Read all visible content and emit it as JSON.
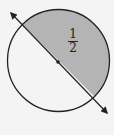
{
  "diagram": {
    "type": "circle-fraction",
    "shape": "circle",
    "divided_by": "diameter line with arrows",
    "shaded_part": "upper-right half",
    "label": {
      "numerator": "1",
      "denominator": "2"
    },
    "colors": {
      "shade": "#b4b4b4",
      "stroke": "#222222",
      "background": "#f4f4f4"
    }
  }
}
